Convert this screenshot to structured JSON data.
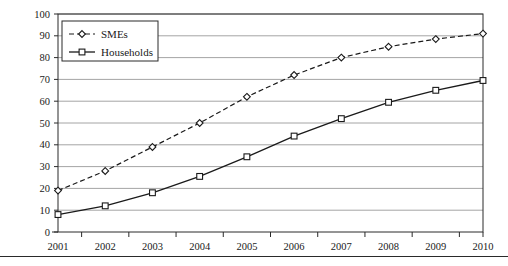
{
  "chart_data": {
    "type": "line",
    "title": "",
    "xlabel": "",
    "ylabel": "",
    "categories": [
      "2001",
      "2002",
      "2003",
      "2004",
      "2005",
      "2006",
      "2007",
      "2008",
      "2009",
      "2010"
    ],
    "series": [
      {
        "name": "SMEs",
        "marker": "diamond",
        "linestyle": "dashed",
        "values": [
          19,
          28,
          39,
          50,
          62,
          72,
          80,
          85,
          88.5,
          91
        ]
      },
      {
        "name": "Households",
        "marker": "square",
        "linestyle": "solid",
        "values": [
          8,
          12,
          18,
          25.5,
          34.5,
          44,
          52,
          59.5,
          65,
          69.5
        ]
      }
    ],
    "ylim": [
      0,
      100
    ],
    "ytick_step": 10,
    "yticks": [
      "0",
      "10",
      "20",
      "30",
      "40",
      "50",
      "60",
      "70",
      "80",
      "90",
      "100"
    ],
    "grid": "horizontal",
    "legend_position": "top-left",
    "colors": {
      "line": "#1a1a1a",
      "grid": "#9a9a9a",
      "axis": "#2a2a2a",
      "marker_fill": "#ffffff",
      "background": "#ffffff"
    }
  },
  "legend": {
    "entries": [
      {
        "label": "SMEs"
      },
      {
        "label": "Households"
      }
    ]
  }
}
